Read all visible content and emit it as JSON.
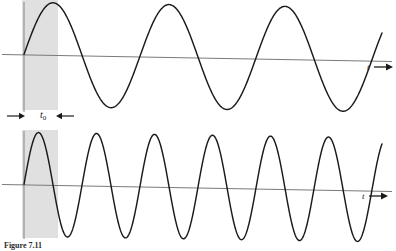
{
  "figure": {
    "caption_label": "Figure 7.11",
    "caption_text": "",
    "t0_symbol": "t",
    "t0_subscript": "0",
    "axis_label_top": "t",
    "axis_label_bottom": "t",
    "band_color": "#e0e0e0",
    "curve_color": "#1a1a1a",
    "axis_color": "#808080",
    "background_color": "#ffffff"
  },
  "chart_data": {
    "type": "line",
    "title": "",
    "subtitle": "",
    "xlabel": "t",
    "ylabel": "",
    "grid": false,
    "legend_position": "none",
    "annotations": [
      {
        "name": "t0-interval",
        "label": "t0",
        "x_start": 22,
        "x_end": 58,
        "description": "shaded vertical band marking sampling interval t0"
      }
    ],
    "panels": [
      {
        "name": "top-waveform",
        "axis_y": 57,
        "axis_x_start": 2,
        "axis_x_end": 392,
        "axis_tilt_px": 6,
        "wave_start_x": 24,
        "wave_end_x": 382,
        "amplitude": 52,
        "cycles": 3.1,
        "period_px": 116,
        "phase": 0,
        "x_axis_arrow_label": "t"
      },
      {
        "name": "bottom-waveform",
        "axis_y": 187,
        "axis_x_start": 2,
        "axis_x_end": 392,
        "axis_tilt_px": 6,
        "wave_start_x": 24,
        "wave_end_x": 382,
        "amplitude": 52,
        "cycles": 6.2,
        "period_px": 58,
        "phase": 0,
        "x_axis_arrow_label": "t"
      }
    ],
    "series": [
      {
        "name": "low-frequency-sine",
        "panel": "top-waveform",
        "frequency_relative": 1,
        "values_description": "sin(2*pi*(x-24)/116) sampled 24..382"
      },
      {
        "name": "high-frequency-sine",
        "panel": "bottom-waveform",
        "frequency_relative": 2,
        "values_description": "sin(2*pi*(x-24)/58) sampled 24..382"
      }
    ]
  }
}
